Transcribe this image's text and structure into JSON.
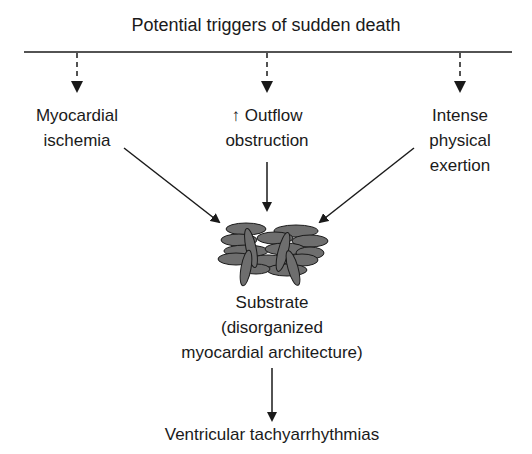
{
  "title": "Potential triggers of sudden death",
  "triggers": [
    {
      "line1": "Myocardial",
      "line2": "ischemia",
      "line3": ""
    },
    {
      "line1": "↑ Outflow",
      "line2": "obstruction",
      "line3": ""
    },
    {
      "line1": "Intense",
      "line2": "physical",
      "line3": "exertion"
    }
  ],
  "substrate": {
    "line1": "Substrate",
    "line2": "(disorganized",
    "line3": "myocardial architecture)"
  },
  "outcome": "Ventricular tachyarrhythmias",
  "colors": {
    "line": "#1a1a1a",
    "cell_fill": "#6e6e6e",
    "cell_stroke": "#1a1a1a"
  }
}
